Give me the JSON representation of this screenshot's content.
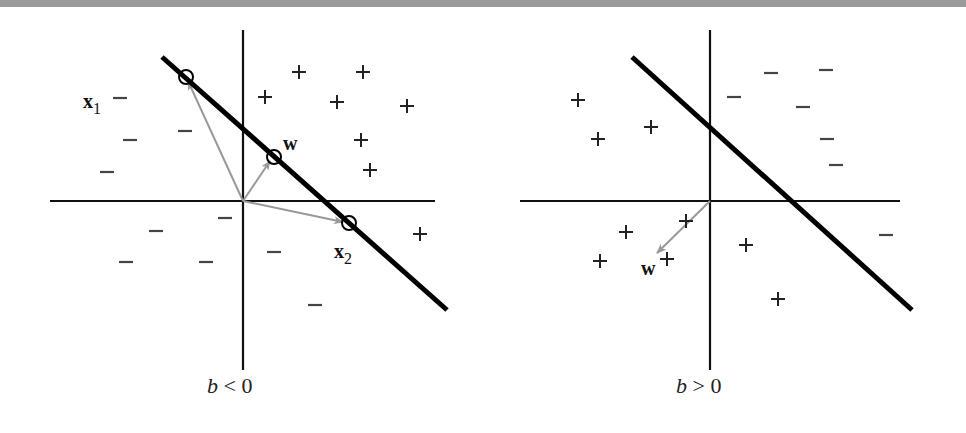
{
  "header_bar": {
    "color": "#9a9a9a"
  },
  "colors": {
    "axis": "#111111",
    "boundary": "#000000",
    "vector": "#999999",
    "marker": "#222222"
  },
  "panels": [
    {
      "id": "left",
      "caption_var": "b",
      "caption_op": "<",
      "caption_val": "0",
      "caption": "b < 0",
      "origin": [
        243,
        201
      ],
      "vertical_axis": {
        "x": 243,
        "y1": 30,
        "y2": 370
      },
      "horizontal_axis": {
        "y": 201,
        "x1": 50,
        "x2": 435
      },
      "boundary": {
        "x1": 162,
        "y1": 57,
        "x2": 447,
        "y2": 310
      },
      "circles": [
        {
          "name": "x1",
          "cx": 186,
          "cy": 77
        },
        {
          "name": "w",
          "cx": 274,
          "cy": 157
        },
        {
          "name": "x2",
          "cx": 349,
          "cy": 223
        }
      ],
      "vectors": [
        {
          "name": "x1",
          "to": [
            188,
            81
          ]
        },
        {
          "name": "w",
          "to": [
            270,
            161
          ]
        },
        {
          "name": "x2",
          "to": [
            343,
            222
          ]
        }
      ],
      "labels": [
        {
          "text": "x",
          "sub": "1",
          "x": 83,
          "y": 108
        },
        {
          "text": "w",
          "sub": "",
          "x": 283,
          "y": 150
        },
        {
          "text": "x",
          "sub": "2",
          "x": 334,
          "y": 258
        }
      ],
      "plus": [
        [
          299,
          72
        ],
        [
          363,
          72
        ],
        [
          265,
          97
        ],
        [
          337,
          102
        ],
        [
          407,
          106
        ],
        [
          361,
          140
        ],
        [
          370,
          170
        ],
        [
          420,
          234
        ]
      ],
      "minus": [
        [
          120,
          98
        ],
        [
          130,
          140
        ],
        [
          185,
          131
        ],
        [
          107,
          172
        ],
        [
          156,
          231
        ],
        [
          225,
          218
        ],
        [
          126,
          262
        ],
        [
          206,
          262
        ],
        [
          274,
          252
        ],
        [
          315,
          305
        ]
      ]
    },
    {
      "id": "right",
      "caption_var": "b",
      "caption_op": ">",
      "caption_val": "0",
      "caption": "b > 0",
      "origin": [
        710,
        201
      ],
      "vertical_axis": {
        "x": 710,
        "y1": 30,
        "y2": 370
      },
      "horizontal_axis": {
        "y": 201,
        "x1": 520,
        "x2": 900
      },
      "boundary": {
        "x1": 632,
        "y1": 57,
        "x2": 912,
        "y2": 310
      },
      "circles": [],
      "vectors": [
        {
          "name": "w",
          "to": [
            657,
            253
          ]
        }
      ],
      "labels": [
        {
          "text": "w",
          "sub": "",
          "x": 641,
          "y": 275
        }
      ],
      "plus": [
        [
          578,
          100
        ],
        [
          598,
          139
        ],
        [
          651,
          127
        ],
        [
          686,
          221
        ],
        [
          626,
          232
        ],
        [
          600,
          261
        ],
        [
          667,
          259
        ],
        [
          746,
          245
        ],
        [
          778,
          299
        ]
      ],
      "minus": [
        [
          734,
          97
        ],
        [
          826,
          70
        ],
        [
          771,
          73
        ],
        [
          803,
          107
        ],
        [
          827,
          139
        ],
        [
          836,
          165
        ],
        [
          886,
          235
        ]
      ]
    }
  ]
}
